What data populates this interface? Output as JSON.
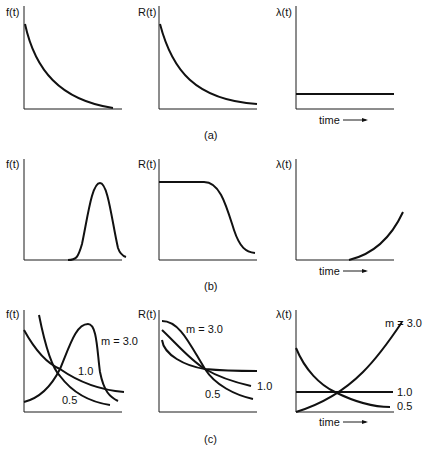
{
  "figure": {
    "rows": [
      {
        "label": "(a)",
        "panels": [
          {
            "ylabel": "f(t)",
            "xlabel": ""
          },
          {
            "ylabel": "R(t)",
            "xlabel": ""
          },
          {
            "ylabel": "λ(t)",
            "xlabel": "time"
          }
        ]
      },
      {
        "label": "(b)",
        "panels": [
          {
            "ylabel": "f(t)",
            "xlabel": ""
          },
          {
            "ylabel": "R(t)",
            "xlabel": ""
          },
          {
            "ylabel": "λ(t)",
            "xlabel": "time"
          }
        ]
      },
      {
        "label": "(c)",
        "panels": [
          {
            "ylabel": "f(t)",
            "xlabel": "",
            "annotations": [
              "m = 3.0",
              "1.0",
              "0.5"
            ]
          },
          {
            "ylabel": "R(t)",
            "xlabel": "",
            "annotations": [
              "m = 3.0",
              "1.0",
              "0.5"
            ]
          },
          {
            "ylabel": "λ(t)",
            "xlabel": "time",
            "annotations": [
              "m = 3.0",
              "1.0",
              "0.5"
            ]
          }
        ]
      }
    ]
  }
}
